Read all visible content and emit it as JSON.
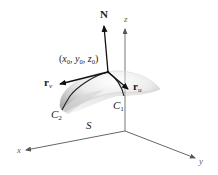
{
  "figure": {
    "labels": {
      "normal": "N",
      "z_axis": "z",
      "x_axis": "x",
      "y_axis": "y",
      "point": {
        "open": "(",
        "x": "x",
        "x_sub": "0",
        "sep1": ", ",
        "y": "y",
        "y_sub": "0",
        "sep2": ", ",
        "z": "z",
        "z_sub": "0",
        "close": ")"
      },
      "r_v": {
        "base": "r",
        "sub": "v"
      },
      "r_u": {
        "base": "r",
        "sub": "u"
      },
      "curve1": {
        "base": "C",
        "sub": "1"
      },
      "curve2": {
        "base": "C",
        "sub": "2"
      },
      "surface": "S"
    },
    "colors": {
      "axis": "#555555",
      "vector": "#111111",
      "surface_light": "#f2f2f2",
      "surface_dark": "#b8b8b8",
      "curve": "#222222"
    }
  }
}
